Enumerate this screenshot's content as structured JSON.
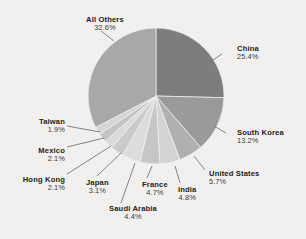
{
  "chart_data": {
    "type": "pie",
    "title": "",
    "subtitle": "",
    "xlabel": "",
    "ylabel": "",
    "legend_position": "callout-labels",
    "grid": false,
    "start_angle_deg": 0,
    "direction": "clockwise",
    "categories": [
      "China",
      "South Korea",
      "United States",
      "India",
      "France",
      "Saudi Arabia",
      "Japan",
      "Hong Kong",
      "Mexico",
      "Taiwan",
      "All Others"
    ],
    "values": [
      25.4,
      13.2,
      5.7,
      4.8,
      4.7,
      4.4,
      3.1,
      2.1,
      2.1,
      1.9,
      32.6
    ],
    "value_suffix": "%",
    "slices": [
      {
        "label": "China",
        "value": 25.4,
        "value_text": "25.4%",
        "color": "#7d7d7d",
        "label_side": "right",
        "label_x": 237,
        "label_y": 45,
        "leader": [
          [
            222,
            54
          ],
          [
            210,
            62
          ]
        ]
      },
      {
        "label": "South Korea",
        "value": 13.2,
        "value_text": "13.2%",
        "color": "#9a9a9a",
        "label_side": "right",
        "label_x": 237,
        "label_y": 129,
        "leader": [
          [
            226,
            133
          ],
          [
            214,
            126
          ]
        ]
      },
      {
        "label": "United States",
        "value": 5.7,
        "value_text": "5.7%",
        "color": "#b0b0b0",
        "label_side": "right",
        "label_x": 209,
        "label_y": 170,
        "leader": [
          [
            205,
            170
          ],
          [
            194,
            156
          ]
        ]
      },
      {
        "label": "India",
        "value": 4.8,
        "value_text": "4.8%",
        "color": "#d3d3d3",
        "label_side": "center",
        "label_x": 178,
        "label_y": 186,
        "leader": [
          [
            180,
            183
          ],
          [
            175,
            166
          ]
        ]
      },
      {
        "label": "France",
        "value": 4.7,
        "value_text": "4.7%",
        "color": "#c6c6c6",
        "label_side": "center",
        "label_x": 142,
        "label_y": 181,
        "leader": [
          [
            147,
            178
          ],
          [
            152,
            166
          ]
        ]
      },
      {
        "label": "Saudi Arabia",
        "value": 4.4,
        "value_text": "4.4%",
        "color": "#dcdcdc",
        "label_side": "center",
        "label_x": 109,
        "label_y": 205,
        "leader": [
          [
            121,
            203
          ],
          [
            135,
            163
          ]
        ]
      },
      {
        "label": "Japan",
        "value": 3.1,
        "value_text": "3.1%",
        "color": "#cbcbcb",
        "label_side": "center",
        "label_x": 86,
        "label_y": 179,
        "leader": [
          [
            97,
            176
          ],
          [
            121,
            153
          ]
        ]
      },
      {
        "label": "Hong Kong",
        "value": 2.1,
        "value_text": "2.1%",
        "color": "#dadada",
        "label_side": "left",
        "label_x": 65,
        "label_y": 176,
        "leader": [
          [
            67,
            174
          ],
          [
            111,
            146
          ]
        ]
      },
      {
        "label": "Mexico",
        "value": 2.1,
        "value_text": "2.1%",
        "color": "#c4c4c4",
        "label_side": "left",
        "label_x": 65,
        "label_y": 147,
        "leader": [
          [
            67,
            147
          ],
          [
            104,
            138
          ]
        ]
      },
      {
        "label": "Taiwan",
        "value": 1.9,
        "value_text": "1.9%",
        "color": "#d5d5d5",
        "label_side": "left",
        "label_x": 65,
        "label_y": 118,
        "leader": [
          [
            67,
            126
          ],
          [
            100,
            132
          ]
        ]
      },
      {
        "label": "All Others",
        "value": 32.6,
        "value_text": "32.6%",
        "color": "#a8a8a8",
        "label_side": "center",
        "label_x": 86,
        "label_y": 16,
        "leader": [
          [
            101,
            31
          ],
          [
            114,
            41
          ]
        ]
      }
    ],
    "geometry": {
      "cx": 156,
      "cy": 96,
      "r": 68
    },
    "background_color": "#f1f0ee"
  }
}
